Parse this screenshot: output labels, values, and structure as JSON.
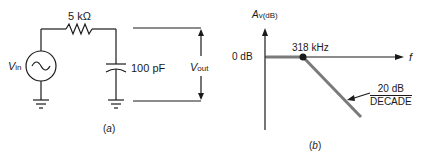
{
  "figure_a": {
    "caption": "(a)",
    "resistor_label": "5 kΩ",
    "capacitor_label": "100 pF",
    "source_label_main": "V",
    "source_label_sub": "in",
    "output_label_main": "V",
    "output_label_sub": "out"
  },
  "figure_b": {
    "caption": "(b)",
    "y_axis_label_main": "A",
    "y_axis_label_sub": "v(dB)",
    "x_axis_label": "f",
    "zero_db_label": "0 dB",
    "cutoff_label": "318 kHz",
    "slope_numerator": "20 dB",
    "slope_denominator": "DECADE"
  },
  "colors": {
    "line": "#1a1a1a",
    "response_curve": "#7a7a7a"
  }
}
